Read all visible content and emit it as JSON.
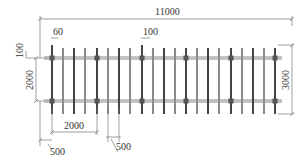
{
  "drawing": {
    "type": "plan-view-dimensioned-drawing",
    "colors": {
      "background": "#ffffff",
      "bar_dark": "#444444",
      "bar_light": "#8a8a8a",
      "rail": "#aaaaaa",
      "dimension_line": "#777777",
      "text": "#333333"
    },
    "dimensions": {
      "overall_length": "11000",
      "overall_width": "3000",
      "rail_spacing": "2000",
      "top_offset": "100",
      "bar_width": "60",
      "bar_gap_label": "100",
      "post_spacing": "2000",
      "end_offset": "500",
      "bar_spacing": "500"
    },
    "structure": {
      "bar_count": 21,
      "rail_count": 2,
      "bar_x_positions": [
        52,
        63,
        74,
        85,
        97,
        108,
        119,
        130,
        142,
        153,
        164,
        175,
        186,
        197,
        208,
        219,
        231,
        242,
        253,
        264,
        275
      ],
      "dark_bars": [
        0,
        2,
        4,
        6,
        8,
        10,
        12,
        14,
        16,
        18,
        20
      ],
      "node_bars": [
        0,
        4,
        8,
        12,
        16,
        20
      ]
    }
  }
}
